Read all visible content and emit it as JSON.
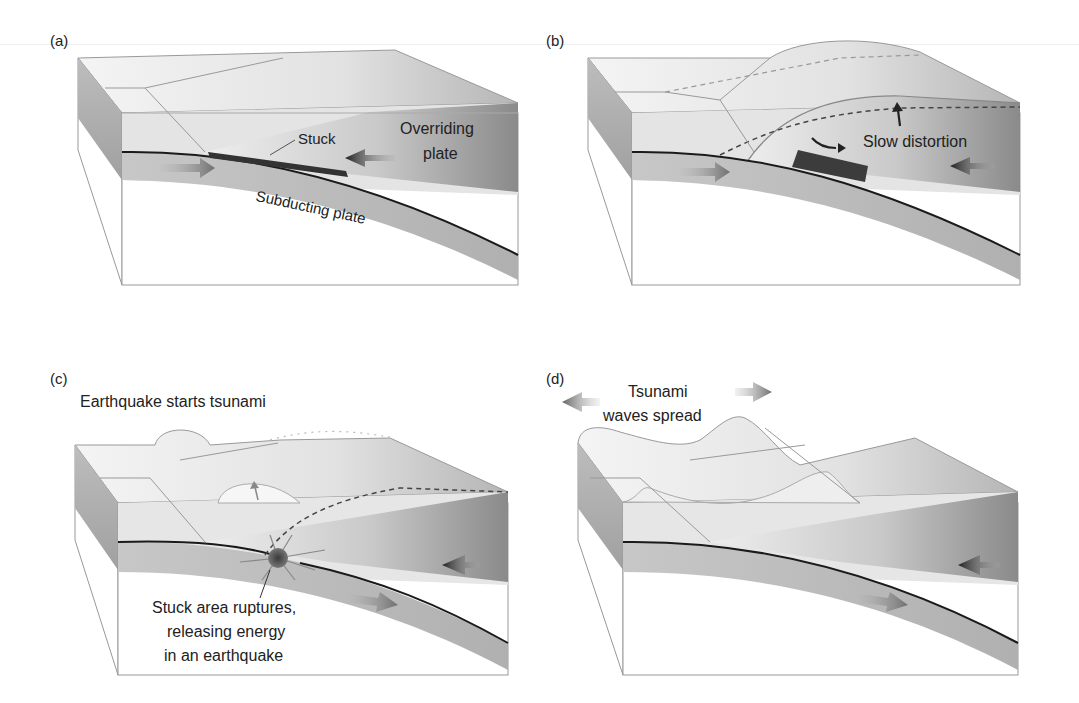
{
  "figure": {
    "panels": [
      {
        "id": "a",
        "label": "(a)",
        "annotations": {
          "stuck": "Stuck",
          "overriding_line1": "Overriding",
          "overriding_line2": "plate",
          "subducting": "Subducting plate"
        }
      },
      {
        "id": "b",
        "label": "(b)",
        "annotations": {
          "slow_distortion": "Slow distortion"
        }
      },
      {
        "id": "c",
        "label": "(c)",
        "annotations": {
          "title": "Earthquake starts tsunami",
          "rupture_line1": "Stuck area ruptures,",
          "rupture_line2": "releasing energy",
          "rupture_line3": "in an earthquake"
        }
      },
      {
        "id": "d",
        "label": "(d)",
        "annotations": {
          "title_line1": "Tsunami",
          "title_line2": "waves spread"
        }
      }
    ],
    "colors": {
      "plate_light": "#e6e6e6",
      "plate_mid": "#bdbdbd",
      "plate_dark": "#7a7a7a",
      "fault_line": "#1a1a1a",
      "stuck_zone": "#3c3c3c",
      "arrow_dark": "#2b2b2b",
      "arrow_light": "#8c8c8c"
    }
  }
}
